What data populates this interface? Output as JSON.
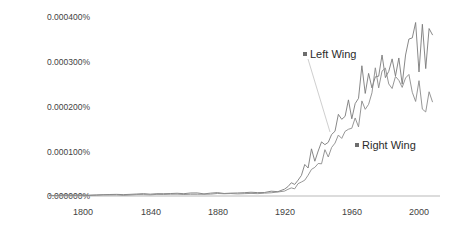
{
  "chart_data": {
    "type": "line",
    "title": "",
    "xlabel": "",
    "ylabel": "",
    "xlim": [
      1780,
      2008
    ],
    "ylim": [
      0,
      0.00042
    ],
    "grid": false,
    "legend_position": "inline-annotation",
    "ytick_labels": [
      "0.000400%",
      "0.000300%",
      "0.000200%",
      "0.000100%",
      "0.000000%"
    ],
    "ytick_values": [
      0.0004,
      0.0003,
      0.0002,
      0.0001,
      0.0
    ],
    "xtick_labels": [
      "1800",
      "1840",
      "1880",
      "1920",
      "1960",
      "2000"
    ],
    "xtick_values": [
      1800,
      1840,
      1880,
      1920,
      1960,
      2000
    ],
    "x": [
      1780,
      1784,
      1788,
      1792,
      1796,
      1800,
      1804,
      1808,
      1812,
      1816,
      1820,
      1824,
      1828,
      1832,
      1836,
      1840,
      1844,
      1848,
      1852,
      1856,
      1860,
      1864,
      1868,
      1872,
      1876,
      1880,
      1884,
      1888,
      1892,
      1896,
      1900,
      1904,
      1908,
      1912,
      1916,
      1920,
      1922,
      1924,
      1926,
      1928,
      1930,
      1932,
      1934,
      1936,
      1938,
      1940,
      1942,
      1944,
      1946,
      1948,
      1950,
      1952,
      1954,
      1956,
      1958,
      1960,
      1962,
      1964,
      1966,
      1968,
      1970,
      1972,
      1974,
      1976,
      1978,
      1980,
      1982,
      1984,
      1986,
      1988,
      1990,
      1992,
      1994,
      1996,
      1998,
      2000,
      2002,
      2004,
      2006,
      2008
    ],
    "series": [
      {
        "name": "Left Wing",
        "color": "#7a7a7a",
        "values": [
          1.5e-06,
          1.2e-06,
          1.8e-06,
          1.6e-06,
          2e-06,
          2.2e-06,
          1.8e-06,
          2.5e-06,
          3e-06,
          2.8e-06,
          3.5e-06,
          3e-06,
          3.8e-06,
          4.2e-06,
          4.8e-06,
          4e-06,
          4.5e-06,
          5.2e-06,
          4.8e-06,
          5.5e-06,
          5e-06,
          5.8e-06,
          6.2e-06,
          5.5e-06,
          6e-06,
          6.8e-06,
          6.5e-06,
          7.2e-06,
          7e-06,
          7.8e-06,
          8.2e-06,
          7.5e-06,
          8.8e-06,
          9.5e-06,
          1.1e-05,
          1.4e-05,
          2.3e-05,
          2.9e-05,
          2.5e-05,
          3.8e-05,
          4.2e-05,
          6.2e-05,
          7e-05,
          9.2e-05,
          8.6e-05,
          0.000115,
          0.000105,
          0.000132,
          0.000125,
          0.000152,
          0.00017,
          0.000162,
          0.000188,
          0.00018,
          0.000205,
          0.000195,
          0.000225,
          0.00022,
          0.00026,
          0.000245,
          0.00029,
          0.000275,
          0.000305,
          0.00028,
          0.0003,
          0.000285,
          0.00027,
          0.0003,
          0.000275,
          0.00031,
          0.000285,
          0.0003,
          0.00032,
          0.000305,
          0.000335,
          0.000315,
          0.00034,
          0.000305,
          0.00033,
          0.00035
        ]
      },
      {
        "name": "Right Wing",
        "color": "#8a8a8a",
        "values": [
          1e-06,
          8e-07,
          1.2e-06,
          1e-06,
          1.4e-06,
          1.5e-06,
          1.2e-06,
          1.8e-06,
          2e-06,
          1.8e-06,
          2.4e-06,
          2e-06,
          2.6e-06,
          3e-06,
          3.4e-06,
          2.8e-06,
          3.2e-06,
          3.8e-06,
          3.4e-06,
          4e-06,
          3.6e-06,
          4.2e-06,
          4.6e-06,
          4e-06,
          4.4e-06,
          5e-06,
          4.8e-06,
          5.4e-06,
          5.2e-06,
          5.8e-06,
          6.2e-06,
          5.6e-06,
          6.6e-06,
          7.2e-06,
          8e-06,
          1e-05,
          1.4e-05,
          1.8e-05,
          1.6e-05,
          2.4e-05,
          2.8e-05,
          4e-05,
          4.6e-05,
          6.2e-05,
          5.8e-05,
          8e-05,
          7.4e-05,
          9.5e-05,
          9e-05,
          0.000112,
          0.000128,
          0.000122,
          0.000145,
          0.00014,
          0.000165,
          0.000158,
          0.000185,
          0.00018,
          0.000215,
          0.000208,
          0.00024,
          0.00023,
          0.00026,
          0.000248,
          0.000275,
          0.00026,
          0.000245,
          0.00027,
          0.00025,
          0.00028,
          0.00026,
          0.00027,
          0.00025,
          0.000235,
          0.00025,
          0.00023,
          0.00022,
          0.000205,
          0.000215,
          0.00021
        ]
      }
    ],
    "annotations": [
      {
        "label": "Left Wing",
        "x": 1949,
        "y": 0.000333,
        "marker_x": 305,
        "marker_y": 54,
        "leader_to_x": 330,
        "leader_to_y": 132
      },
      {
        "label": "Right Wing",
        "x": 1965,
        "y": 0.000115,
        "marker_x": 357,
        "marker_y": 145,
        "leader_to_x": 347,
        "leader_to_y": 140
      }
    ],
    "axis_color": "#b9b9b9"
  }
}
